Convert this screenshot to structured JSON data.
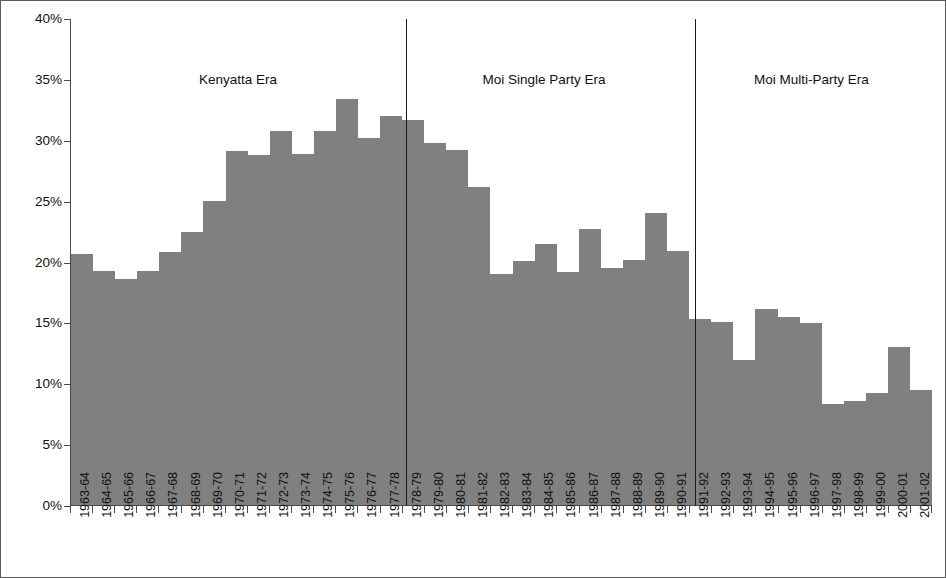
{
  "chart_data": {
    "type": "bar",
    "title": "",
    "xlabel": "",
    "ylabel": "",
    "ylim": [
      0,
      40
    ],
    "ytick_values": [
      0,
      5,
      10,
      15,
      20,
      25,
      30,
      35,
      40
    ],
    "ytick_labels": [
      "0%",
      "5%",
      "10%",
      "15%",
      "20%",
      "25%",
      "30%",
      "35%",
      "40%"
    ],
    "grid": false,
    "legend": false,
    "bar_color": "#808080",
    "axis_color": "#4a4a4a",
    "categories": [
      "1963-64",
      "1964-65",
      "1965-66",
      "1966-67",
      "1967-68",
      "1968-69",
      "1969-70",
      "1970-71",
      "1971-72",
      "1972-73",
      "1973-74",
      "1974-75",
      "1975-76",
      "1976-77",
      "1977-78",
      "1978-79",
      "1979-80",
      "1980-81",
      "1981-82",
      "1982-83",
      "1983-84",
      "1984-85",
      "1985-86",
      "1986-87",
      "1987-88",
      "1988-89",
      "1989-90",
      "1990-91",
      "1991-92",
      "1992-93",
      "1993-94",
      "1994-95",
      "1995-96",
      "1996-97",
      "1997-98",
      "1998-99",
      "1999-00",
      "2000-01",
      "2001-02"
    ],
    "values": [
      20.7,
      19.3,
      18.6,
      19.3,
      20.8,
      22.5,
      25.0,
      29.1,
      28.8,
      30.8,
      28.9,
      30.8,
      33.4,
      30.2,
      32.0,
      31.7,
      29.8,
      29.2,
      26.2,
      19.0,
      20.1,
      21.5,
      19.2,
      22.7,
      19.5,
      20.2,
      24.0,
      20.9,
      15.3,
      15.1,
      11.9,
      16.1,
      15.5,
      15.0,
      8.3,
      8.6,
      9.2,
      13.0,
      9.5
    ],
    "annotations": [
      {
        "id": "kenyatta-era",
        "label": "Kenyatta Era",
        "start_category": "1963-64",
        "end_category": "1977-78",
        "center_pct": 19.5
      },
      {
        "id": "moi-single-party-era",
        "label": "Moi Single Party Era",
        "start_category": "1978-79",
        "end_category": "1990-91",
        "center_pct": 55.0
      },
      {
        "id": "moi-multi-party-era",
        "label": "Moi Multi-Party Era",
        "start_category": "1991-92",
        "end_category": "2001-02",
        "center_pct": 86.0
      }
    ],
    "dividers": [
      {
        "id": "divider-kenyatta-moi-single",
        "after_category": "1977-78",
        "pct": 38.98
      },
      {
        "id": "divider-moi-single-multi",
        "after_category": "1990-91",
        "pct": 72.51
      }
    ]
  }
}
